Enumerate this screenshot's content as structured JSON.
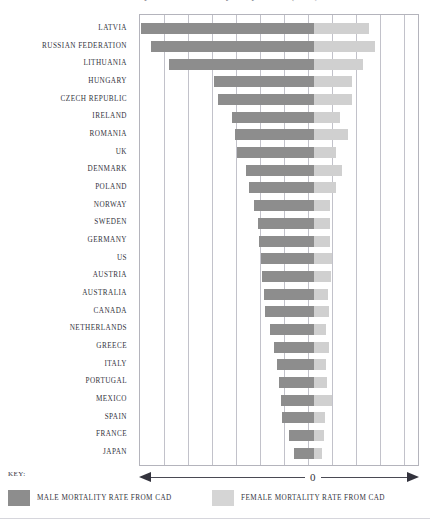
{
  "title": "Mortality rates from coronary artery disease (CAD)",
  "key": {
    "label": "KEY:"
  },
  "axis": {
    "zero_label": "0"
  },
  "legend": [
    {
      "name": "male-legend",
      "label": "MALE MORTALITY RATE FROM CAD",
      "color": "#8d8d8d"
    },
    {
      "name": "female-legend",
      "label": "FEMALE MORTALITY RATE FROM CAD",
      "color": "#d5d5d5"
    }
  ],
  "chart_data": {
    "type": "bar",
    "orientation": "horizontal",
    "layout": "diverging-back-to-back",
    "title": "Mortality rates from coronary artery disease (CAD)",
    "xlabel": "",
    "ylabel": "",
    "grid": true,
    "legend_position": "bottom",
    "zero_position_px": 312.5,
    "plot_left_px": 139,
    "plot_right_px": 419,
    "gridline_spacing_px": 24,
    "colors": {
      "male": "#8d8d8d",
      "female": "#d0d0d0"
    },
    "categories": [
      "LATVIA",
      "RUSSIAN FEDERATION",
      "LITHUANIA",
      "HUNGARY",
      "CZECH REPUBLIC",
      "IRELAND",
      "ROMANIA",
      "UK",
      "DENMARK",
      "POLAND",
      "NORWAY",
      "SWEDEN",
      "GERMANY",
      "US",
      "AUSTRIA",
      "AUSTRALIA",
      "CANADA",
      "NETHERLANDS",
      "GREECE",
      "ITALY",
      "PORTUGAL",
      "MEXICO",
      "SPAIN",
      "FRANCE",
      "JAPAN"
    ],
    "series": [
      {
        "name": "MALE MORTALITY RATE FROM CAD",
        "direction": "left",
        "values": [
          173,
          163,
          145,
          100,
          96,
          82,
          79,
          77,
          68,
          65,
          60,
          56,
          55,
          53,
          52,
          50,
          49,
          44,
          40,
          37,
          35,
          33,
          32,
          25,
          20
        ]
      },
      {
        "name": "FEMALE MORTALITY RATE FROM CAD",
        "direction": "right",
        "values": [
          55,
          61,
          49,
          38,
          38,
          26,
          34,
          22,
          28,
          22,
          16,
          16,
          16,
          18,
          17,
          14,
          15,
          12,
          15,
          12,
          13,
          18,
          11,
          10,
          8
        ]
      }
    ]
  }
}
